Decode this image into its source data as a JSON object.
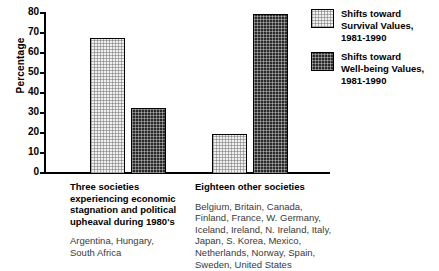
{
  "chart_data": {
    "type": "bar",
    "title": "",
    "xlabel": "",
    "ylabel": "Percentage",
    "ylim": [
      0,
      80
    ],
    "yticks": [
      0,
      10,
      20,
      30,
      40,
      50,
      60,
      70,
      80
    ],
    "ytick_labels": [
      "0",
      "10",
      "20",
      "30",
      "40",
      "50",
      "60",
      "70",
      "80"
    ],
    "grid": false,
    "legend_position": "right",
    "categories": [
      "Three societies\nexperiencing economic\nstagnation and political\nupheaval during 1980's",
      "Eighteen other societies"
    ],
    "category_notes": [
      "Argentina, Hungary,\nSouth Africa",
      "Belgium, Britain, Canada,\nFinland, France, W. Germany,\nIceland, Ireland, N. Ireland, Italy,\nJapan, S. Korea, Mexico,\nNetherlands, Norway, Spain,\nSweden, United States"
    ],
    "series": [
      {
        "name": "Shifts toward\nSurvival Values,\n1981-1990",
        "values": [
          68,
          20
        ],
        "fill": "light-dotted",
        "color": "#f0f0f0"
      },
      {
        "name": "Shifts toward\nWell-being Values,\n1981-1990",
        "values": [
          33,
          80
        ],
        "fill": "dark-dotted",
        "color": "#2a2a2a"
      }
    ]
  },
  "axis": {
    "y_title": "Percentage"
  },
  "legend": {
    "entries": [
      {
        "label": "Shifts toward\nSurvival Values,\n1981-1990"
      },
      {
        "label": "Shifts toward\nWell-being Values,\n1981-1990"
      }
    ]
  },
  "groups": [
    {
      "title": "Three societies\nexperiencing economic\nstagnation and political\nupheaval during 1980's",
      "note": "Argentina, Hungary,\nSouth Africa"
    },
    {
      "title": "Eighteen other societies",
      "note": "Belgium, Britain, Canada,\nFinland, France, W. Germany,\nIceland, Ireland, N. Ireland, Italy,\nJapan, S. Korea, Mexico,\nNetherlands, Norway, Spain,\nSweden, United States"
    }
  ]
}
